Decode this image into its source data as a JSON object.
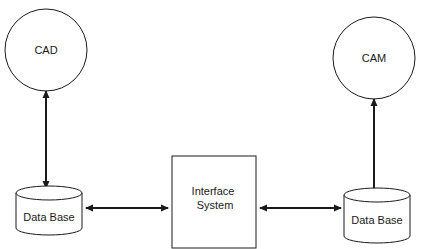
{
  "diagram": {
    "nodes": {
      "cad": {
        "label": "CAD",
        "shape": "circle"
      },
      "cam": {
        "label": "CAM",
        "shape": "circle"
      },
      "db_left": {
        "label": "Data Base",
        "shape": "cylinder"
      },
      "db_right": {
        "label": "Data Base",
        "shape": "cylinder"
      },
      "interface": {
        "line1": "Interface",
        "line2": "System",
        "shape": "rectangle"
      }
    },
    "edges": [
      {
        "from": "cad",
        "to": "db_left",
        "direction": "bidirectional"
      },
      {
        "from": "db_left",
        "to": "interface",
        "direction": "bidirectional"
      },
      {
        "from": "interface",
        "to": "db_right",
        "direction": "bidirectional"
      },
      {
        "from": "cam",
        "to": "db_right",
        "direction": "bidirectional"
      }
    ],
    "colors": {
      "stroke": "#1a1a1a",
      "background": "#ffffff"
    }
  }
}
